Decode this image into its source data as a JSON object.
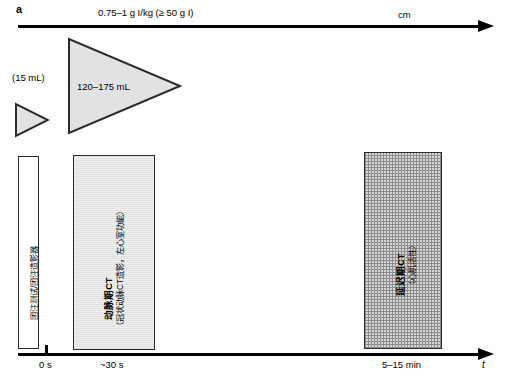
{
  "figure": {
    "panel_label": "a"
  },
  "injection_axis": {
    "dose_label": "0.75–1 g I/kg (≥ 50 g I)",
    "unit_label": "cm",
    "arrow_icon": "arrow-right-icon"
  },
  "boluses": [
    {
      "name": "test-bolus",
      "volume_label": "(15 mL)",
      "shape": "triangle-right"
    },
    {
      "name": "main-bolus",
      "volume_label": "120–175 mL",
      "shape": "triangle-right"
    }
  ],
  "phases": [
    {
      "name": "test-bolus-scan",
      "label_main": "团注测试/团注造影器",
      "label_sub": "",
      "fill": "#ffffff"
    },
    {
      "name": "arterial-phase-ct",
      "label_main": "动脉期CT",
      "label_sub": "（冠状动脉CT造影，左心室功能）",
      "fill": "#efefef"
    },
    {
      "name": "delayed-phase-ct",
      "label_main": "延迟期CT",
      "label_sub": "（心肌活性）",
      "fill": "#d6d6d6"
    }
  ],
  "time_axis": {
    "ticks": [
      {
        "label": "0 s"
      },
      {
        "label": "~30 s"
      },
      {
        "label": "5–15 min"
      }
    ],
    "axis_symbol": "t",
    "arrow_icon": "arrow-right-icon"
  }
}
